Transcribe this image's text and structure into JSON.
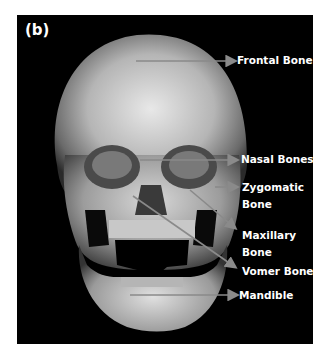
{
  "figure": {
    "panel_label": "(b)",
    "colors": {
      "background": "#000000",
      "arrow": "#8a8a8a",
      "text": "#ffffff"
    },
    "labels": [
      {
        "id": "frontal",
        "line1": "Frontal Bone",
        "line2": ""
      },
      {
        "id": "nasal",
        "line1": "Nasal Bones",
        "line2": ""
      },
      {
        "id": "zygomatic",
        "line1": "Zygomatic",
        "line2": "Bone"
      },
      {
        "id": "maxillary",
        "line1": "Maxillary",
        "line2": "Bone"
      },
      {
        "id": "vomer",
        "line1": "Vomer Bone",
        "line2": ""
      },
      {
        "id": "mandible",
        "line1": "Mandible",
        "line2": ""
      }
    ]
  }
}
